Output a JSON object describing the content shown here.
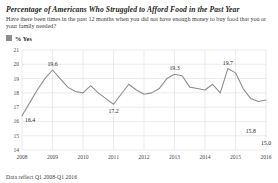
{
  "header": {
    "title": "Percentage of Americans Who Struggled to Afford Food in the Past Year",
    "subtitle": "Have there been times in the past 12 months when you did not have enough money to buy food that you or your family needed?"
  },
  "legend": {
    "label": "% Yes",
    "swatch_color": "#8e8e8e"
  },
  "footnote": "Data reflect Q1 2008-Q1 2016",
  "chart_data": {
    "type": "line",
    "title": "Percentage of Americans Who Struggled to Afford Food in the Past Year",
    "subtitle": "Have there been times in the past 12 months when you did not have enough money to buy food that you or your family needed?",
    "xlabel": "",
    "ylabel": "",
    "ylim": [
      14,
      21
    ],
    "yticks": [
      21,
      20,
      19,
      18,
      17,
      16,
      15,
      14
    ],
    "ytick_labels": [
      "21",
      "20",
      "19",
      "18",
      "17",
      "16",
      "15",
      "14"
    ],
    "xticks": [
      2008,
      2009,
      2010,
      2011,
      2012,
      2013,
      2014,
      2015,
      2016
    ],
    "xtick_labels": [
      "2008",
      "2009",
      "2010",
      "2011",
      "2012",
      "2013",
      "2014",
      "2015",
      "2016"
    ],
    "grid": true,
    "legend_position": "top-left",
    "line_color": "#8e8e8e",
    "series": [
      {
        "name": "% Yes",
        "x": [
          2008.0,
          2008.25,
          2008.5,
          2008.75,
          2009.0,
          2009.25,
          2009.5,
          2009.75,
          2010.0,
          2010.25,
          2010.5,
          2010.75,
          2011.0,
          2011.25,
          2011.5,
          2011.75,
          2012.0,
          2012.25,
          2012.5,
          2012.75,
          2013.0,
          2013.25,
          2013.5,
          2013.75,
          2014.0,
          2014.25,
          2014.5,
          2014.75,
          2015.0,
          2015.25,
          2015.5,
          2015.75,
          2016.0
        ],
        "values": [
          16.4,
          17.3,
          18.2,
          19.0,
          19.6,
          19.0,
          18.4,
          18.1,
          18.0,
          18.5,
          18.0,
          17.6,
          17.2,
          17.9,
          18.6,
          18.2,
          17.9,
          18.0,
          18.3,
          19.0,
          19.3,
          19.2,
          18.4,
          18.3,
          18.2,
          18.6,
          18.0,
          19.7,
          19.4,
          18.3,
          17.6,
          17.4,
          17.5
        ]
      }
    ],
    "point_labels": [
      {
        "x": 2008.0,
        "value": 16.4,
        "text": "16.4",
        "position": "right"
      },
      {
        "x": 2009.0,
        "value": 19.6,
        "text": "19.6",
        "position": "above"
      },
      {
        "x": 2011.0,
        "value": 17.2,
        "text": "17.2",
        "position": "below"
      },
      {
        "x": 2013.0,
        "value": 19.3,
        "text": "19.3",
        "position": "above"
      },
      {
        "x": 2014.75,
        "value": 19.7,
        "text": "19.7",
        "position": "above"
      },
      {
        "x": 2015.5,
        "value": 15.8,
        "text": "15.8",
        "position": "below"
      },
      {
        "x": 2016.0,
        "value": 15.0,
        "text": "15.0",
        "position": "below"
      }
    ]
  }
}
